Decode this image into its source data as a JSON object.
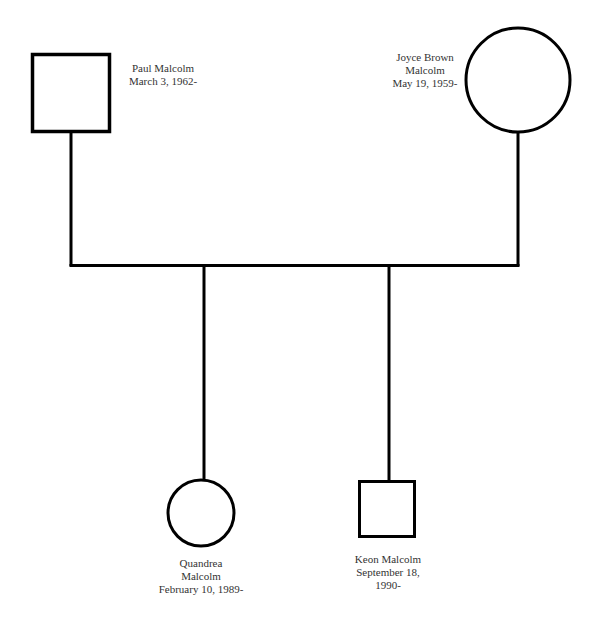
{
  "diagram": {
    "type": "genogram",
    "line_color": "#000000",
    "background": "#ffffff"
  },
  "people": {
    "father": {
      "shape": "square",
      "sex": "male",
      "name": "Paul Malcolm",
      "dates": "March 3, 1962-"
    },
    "mother": {
      "shape": "circle",
      "sex": "female",
      "name_line1": "Joyce Brown",
      "name_line2": "Malcolm",
      "dates": "May 19, 1959-"
    },
    "child1": {
      "shape": "circle",
      "sex": "female",
      "name_line1": "Quandrea",
      "name_line2": "Malcolm",
      "dates": "February 10, 1989-"
    },
    "child2": {
      "shape": "square",
      "sex": "male",
      "name": "Keon Malcolm",
      "dates_line1": "September 18,",
      "dates_line2": "1990-"
    }
  },
  "relationships": [
    {
      "type": "marriage",
      "from": "father",
      "to": "mother"
    },
    {
      "type": "child",
      "parents": [
        "father",
        "mother"
      ],
      "child": "child1"
    },
    {
      "type": "child",
      "parents": [
        "father",
        "mother"
      ],
      "child": "child2"
    }
  ]
}
